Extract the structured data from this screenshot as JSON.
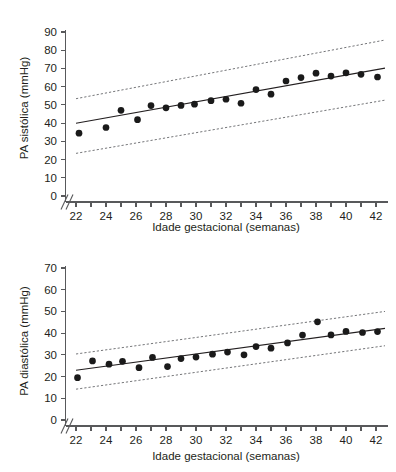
{
  "figure": {
    "panels": [
      "systolic",
      "diastolic"
    ],
    "ink_color": "#231f20",
    "axis_color": "#58595b",
    "point_color": "#1a1a1a",
    "ci_color": "#6d6e71"
  },
  "systolic": {
    "y_axis_title": "PA sistólica (mmHg)",
    "x_axis_title": "Idade gestacional (semanas)",
    "y_ticks": [
      "0",
      "10",
      "20",
      "30",
      "40",
      "50",
      "60",
      "70",
      "80",
      "90"
    ],
    "x_ticks": [
      "22",
      "24",
      "26",
      "28",
      "30",
      "32",
      "34",
      "36",
      "38",
      "40",
      "42"
    ],
    "axis_break": "//"
  },
  "diastolic": {
    "y_axis_title": "PA diastólica (mmHg)",
    "x_axis_title": "Idade gestacional (semanas)",
    "y_ticks": [
      "0",
      "10",
      "20",
      "30",
      "40",
      "50",
      "60",
      "70"
    ],
    "x_ticks": [
      "22",
      "24",
      "26",
      "28",
      "30",
      "32",
      "34",
      "36",
      "38",
      "40",
      "42"
    ],
    "axis_break": "//"
  },
  "chart_data": [
    {
      "type": "scatter",
      "id": "systolic",
      "title": "",
      "xlabel": "Idade gestacional (semanas)",
      "ylabel": "PA sistólica (mmHg)",
      "xlim": [
        21.3,
        42.8
      ],
      "ylim": [
        0,
        93
      ],
      "grid": false,
      "legend": null,
      "x_tick_step_minor": 1,
      "x_tick_values": [
        22,
        23,
        24,
        25,
        26,
        27,
        28,
        29,
        30,
        31,
        32,
        33,
        34,
        35,
        36,
        37,
        38,
        39,
        40,
        41,
        42
      ],
      "x_tick_labels": [
        22,
        24,
        26,
        28,
        30,
        32,
        34,
        36,
        38,
        40,
        42
      ],
      "y_tick_values": [
        0,
        10,
        20,
        30,
        40,
        50,
        60,
        70,
        80,
        90
      ],
      "axis_break_y_between": [
        0,
        20
      ],
      "series": [
        {
          "name": "Observações (média por semana)",
          "marker": "filled-circle",
          "x": [
            22.2,
            24.0,
            25.0,
            26.1,
            27.0,
            28.0,
            29.0,
            29.9,
            31.0,
            32.0,
            33.0,
            34.0,
            35.0,
            36.0,
            37.0,
            38.0,
            39.0,
            40.0,
            41.0,
            42.1
          ],
          "y": [
            34.5,
            37.6,
            47.0,
            41.9,
            49.6,
            48.4,
            49.7,
            50.4,
            52.3,
            53.1,
            50.9,
            58.4,
            55.9,
            63.1,
            65.0,
            67.4,
            65.8,
            67.6,
            66.8,
            65.3
          ]
        },
        {
          "name": "Linha de regressão",
          "type": "line",
          "style": "solid",
          "x": [
            22.0,
            42.6
          ],
          "y": [
            39.9,
            70.2
          ]
        },
        {
          "name": "Limite superior (IC)",
          "type": "line",
          "style": "dotted",
          "x": [
            22.0,
            42.6
          ],
          "y": [
            53.4,
            85.6
          ]
        },
        {
          "name": "Limite inferior (IC)",
          "type": "line",
          "style": "dotted",
          "x": [
            22.0,
            42.6
          ],
          "y": [
            23.4,
            52.6
          ]
        }
      ]
    },
    {
      "type": "scatter",
      "id": "diastolic",
      "title": "",
      "xlabel": "Idade gestacional (semanas)",
      "ylabel": "PA diastólica (mmHg)",
      "xlim": [
        21.3,
        42.8
      ],
      "ylim": [
        0,
        73
      ],
      "grid": false,
      "legend": null,
      "x_tick_step_minor": 1,
      "x_tick_values": [
        22,
        23,
        24,
        25,
        26,
        27,
        28,
        29,
        30,
        31,
        32,
        33,
        34,
        35,
        36,
        37,
        38,
        39,
        40,
        41,
        42
      ],
      "x_tick_labels": [
        22,
        24,
        26,
        28,
        30,
        32,
        34,
        36,
        38,
        40,
        42
      ],
      "y_tick_values": [
        0,
        10,
        20,
        30,
        40,
        50,
        60,
        70
      ],
      "axis_break_y_between": [
        0,
        10
      ],
      "series": [
        {
          "name": "Observações (média por semana)",
          "marker": "filled-circle",
          "x": [
            22.1,
            23.1,
            24.2,
            25.1,
            26.2,
            27.1,
            28.1,
            29.0,
            30.0,
            31.1,
            32.1,
            33.2,
            34.0,
            35.0,
            36.1,
            37.1,
            38.1,
            39.0,
            40.0,
            41.1,
            42.1
          ],
          "y": [
            19.5,
            27.2,
            25.7,
            27.0,
            24.1,
            28.8,
            24.6,
            28.3,
            29.0,
            30.3,
            31.3,
            30.0,
            33.8,
            33.1,
            35.5,
            39.1,
            45.2,
            39.2,
            40.8,
            40.3,
            40.7
          ]
        },
        {
          "name": "Linha de regressão",
          "type": "line",
          "style": "solid",
          "x": [
            22.0,
            42.6
          ],
          "y": [
            22.9,
            42.2
          ]
        },
        {
          "name": "Limite superior (IC)",
          "type": "line",
          "style": "dotted",
          "x": [
            22.0,
            42.6
          ],
          "y": [
            30.4,
            50.0
          ]
        },
        {
          "name": "Limite inferior (IC)",
          "type": "line",
          "style": "dotted",
          "x": [
            22.0,
            42.6
          ],
          "y": [
            14.2,
            34.2
          ]
        }
      ]
    }
  ]
}
